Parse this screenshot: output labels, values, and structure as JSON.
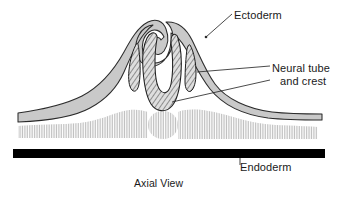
{
  "figure": {
    "title": "Axial View",
    "caption": "Axial View",
    "type": "embryology-cross-section",
    "view": "Axial View"
  },
  "labels": {
    "ectoderm": "Ectoderm",
    "neural_line1": "Neural tube",
    "neural_line2": "and crest",
    "endoderm": "Endoderm",
    "axial_view": "Axial View"
  },
  "structures": [
    {
      "name": "ectoderm",
      "label": "Ectoderm",
      "fill": "#c9c9c9",
      "stroke": "#2b2b2b",
      "pattern": "solid-gray",
      "description": "outer surface layer folding upward into two neural folds"
    },
    {
      "name": "neural-tube",
      "label": "Neural tube",
      "fill": "#d8d8d8",
      "stroke": "#1f1f1f",
      "pattern": "diagonal-crosshatch",
      "description": "central U-shaped invaginating neural groove"
    },
    {
      "name": "neural-crest-left",
      "label": "and crest",
      "fill": "#d8d8d8",
      "stroke": "#1f1f1f",
      "pattern": "diagonal-crosshatch",
      "description": "left crescent of neural crest cells"
    },
    {
      "name": "neural-crest-right",
      "label": "and crest",
      "fill": "#d8d8d8",
      "stroke": "#1f1f1f",
      "pattern": "diagonal-crosshatch",
      "description": "right crescent of neural crest cells"
    },
    {
      "name": "mesoderm-left",
      "label": "",
      "fill": "#d3d3d3",
      "stroke": "none",
      "pattern": "vertical-lines",
      "description": "left somitic mesoderm band"
    },
    {
      "name": "mesoderm-right",
      "label": "",
      "fill": "#d3d3d3",
      "stroke": "none",
      "pattern": "vertical-lines",
      "description": "right somitic mesoderm band"
    },
    {
      "name": "notochord",
      "label": "",
      "fill": "#d3d3d3",
      "stroke": "none",
      "pattern": "vertical-lines",
      "description": "central round notochord"
    },
    {
      "name": "endoderm",
      "label": "Endoderm",
      "fill": "#000000",
      "stroke": "none",
      "pattern": "solid-black",
      "description": "solid black basal bar"
    }
  ],
  "colors": {
    "ectoderm_fill": "#c9c9c9",
    "ectoderm_stroke": "#2b2b2b",
    "hatch_fill": "#d8d8d8",
    "hatch_stroke": "#1f1f1f",
    "mesoderm_fill": "#d3d3d3",
    "endoderm_fill": "#000000",
    "leader_line": "#2b2b2b",
    "text": "#1a1a1a",
    "background": "#ffffff"
  }
}
